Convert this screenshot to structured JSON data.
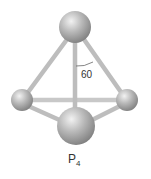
{
  "diagram": {
    "molecule": "P",
    "subscript": "4",
    "angle_label": "60"
  }
}
